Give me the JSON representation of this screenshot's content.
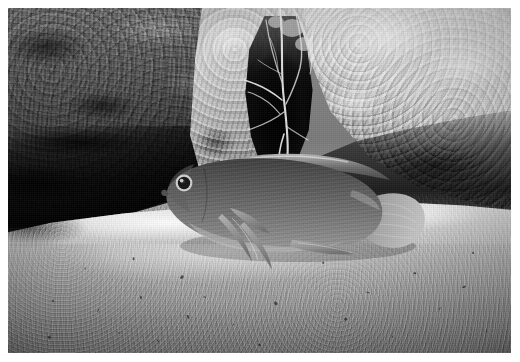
{
  "image": {
    "kind": "underwater-photograph",
    "color_mode": "black-and-white",
    "width_px": 520,
    "height_px": 362,
    "photo": {
      "x": 8,
      "y": 8,
      "width": 503,
      "height": 345
    },
    "margin_color": "#ffffff",
    "caption": ""
  },
  "scene": {
    "title": "Cichlid fish beside rock crevice over sand",
    "subject": "fish",
    "habitat": "rocky lake bottom with sandy substrate",
    "lighting": "strobe from upper left"
  },
  "regions": [
    {
      "name": "rock-left",
      "label": "Dark mottled rock (left wall)",
      "tone": "dark",
      "hex_mid": "#4a4a4a",
      "hex_dark": "#111111",
      "hex_light": "#8d8d8d"
    },
    {
      "name": "rock-mid",
      "label": "Pale rock column (center)",
      "tone": "mid-light",
      "hex_mid": "#b2b2b2",
      "hex_dark": "#6a6a6a",
      "hex_light": "#cfcfcf"
    },
    {
      "name": "rock-right",
      "label": "Pale pitted rock (right wall)",
      "tone": "light",
      "hex_mid": "#cacaca",
      "hex_dark": "#3e3e3e",
      "hex_light": "#e6e6e6"
    },
    {
      "name": "crevice",
      "label": "Dark crevice opening",
      "tone": "black",
      "hex_mid": "#050505"
    },
    {
      "name": "sand-ridge",
      "label": "Bright sand ridge",
      "tone": "bright",
      "hex_mid": "#cfcfcf",
      "hex_light": "#f2f2f2"
    },
    {
      "name": "sand-body",
      "label": "Sandy substrate foreground",
      "tone": "mid",
      "hex_mid": "#8e8e8e",
      "hex_dark": "#6a6a6a"
    }
  ],
  "fish": {
    "label": "Cichlid fish",
    "orientation": "facing left",
    "body_hex": "#6a6a6a",
    "belly_hex": "#9a9a9a",
    "back_hex": "#454545",
    "fin_hex": "#8c8c8c",
    "tail_hex": "#a8a8a8",
    "eye": {
      "label": "Fish eye",
      "pupil_hex": "#151515",
      "ring_hex": "#d6d6d6",
      "x": 176,
      "y": 175
    },
    "parts": [
      {
        "name": "body",
        "label": "Body"
      },
      {
        "name": "head",
        "label": "Head"
      },
      {
        "name": "dorsal-fin",
        "label": "Dorsal fin"
      },
      {
        "name": "pectoral-fin",
        "label": "Pectoral fin"
      },
      {
        "name": "pelvic-fin",
        "label": "Pelvic fins"
      },
      {
        "name": "anal-fin",
        "label": "Anal fin"
      },
      {
        "name": "caudal-fin",
        "label": "Caudal (tail) fin"
      }
    ]
  },
  "roots": {
    "label": "Hanging root strands",
    "hex": "#e8e8e8",
    "count": 9
  },
  "debris": {
    "label": "Sand debris specks",
    "hex": "#2a2a2a",
    "points": [
      {
        "x": 28,
        "y": 318
      },
      {
        "x": 52,
        "y": 300
      },
      {
        "x": 48,
        "y": 336
      },
      {
        "x": 96,
        "y": 310
      },
      {
        "x": 118,
        "y": 332
      },
      {
        "x": 140,
        "y": 296
      },
      {
        "x": 156,
        "y": 340
      },
      {
        "x": 186,
        "y": 316
      },
      {
        "x": 204,
        "y": 296
      },
      {
        "x": 232,
        "y": 324
      },
      {
        "x": 258,
        "y": 344
      },
      {
        "x": 274,
        "y": 302
      },
      {
        "x": 300,
        "y": 330
      },
      {
        "x": 322,
        "y": 262
      },
      {
        "x": 344,
        "y": 318
      },
      {
        "x": 366,
        "y": 292
      },
      {
        "x": 392,
        "y": 336
      },
      {
        "x": 414,
        "y": 272
      },
      {
        "x": 438,
        "y": 308
      },
      {
        "x": 462,
        "y": 286
      },
      {
        "x": 486,
        "y": 330
      },
      {
        "x": 84,
        "y": 268
      },
      {
        "x": 132,
        "y": 258
      },
      {
        "x": 180,
        "y": 276
      },
      {
        "x": 408,
        "y": 244
      },
      {
        "x": 472,
        "y": 252
      }
    ]
  }
}
